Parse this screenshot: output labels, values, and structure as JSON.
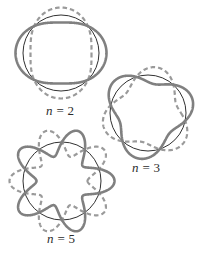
{
  "figure": {
    "background_color": "#ffffff",
    "width": 202,
    "height": 253,
    "style": {
      "circle_color": "#1a1a1a",
      "circle_width": 0.9,
      "solid_curve_color": "#808080",
      "solid_curve_width": 2.6,
      "dashed_curve_color": "#9a9a9a",
      "dashed_curve_width": 2.2,
      "dash_pattern": "4.5,3",
      "label_color": "#2b2b2b"
    }
  },
  "panels": [
    {
      "id": "n2",
      "label_prefix": "n",
      "label_equals": "=",
      "label_value": "2",
      "label_text": "n = 2",
      "n": 2,
      "center_x": 61,
      "center_y": 53,
      "circle_radius": 38,
      "amplitude": 7.5,
      "solid_phase_deg": 0,
      "dashed_phase_deg": 90,
      "label_x": 46,
      "label_y": 103
    },
    {
      "id": "n3",
      "label_prefix": "n",
      "label_equals": "=",
      "label_value": "3",
      "label_text": "n = 3",
      "n": 3,
      "center_x": 148,
      "center_y": 113,
      "circle_radius": 38,
      "amplitude": 8.5,
      "solid_phase_deg": -18,
      "dashed_phase_deg": 42,
      "label_x": 132,
      "label_y": 160
    },
    {
      "id": "n5",
      "label_prefix": "n",
      "label_equals": "=",
      "label_value": "5",
      "label_text": "n = 5",
      "n": 5,
      "center_x": 62,
      "center_y": 181,
      "circle_radius": 39,
      "amplitude": 13.5,
      "solid_phase_deg": 0,
      "dashed_phase_deg": 36,
      "label_x": 47,
      "label_y": 231
    }
  ],
  "chart_data": {
    "type": "line",
    "xlabel": "",
    "ylabel": "",
    "grid": false,
    "legend": "none",
    "series": [
      {
        "name": "n = 2 reference circle",
        "panel": "n2",
        "curve": "circle",
        "radius": 38,
        "center": [
          61,
          53
        ]
      },
      {
        "name": "n = 2 solid curve",
        "panel": "n2",
        "curve": "r = R + A*cos(n*theta)",
        "n": 2,
        "R": 38,
        "A": 7.5,
        "phase_deg": 0,
        "style": "solid"
      },
      {
        "name": "n = 2 dashed curve",
        "panel": "n2",
        "curve": "r = R + A*cos(n*(theta - 90deg))",
        "n": 2,
        "R": 38,
        "A": 7.5,
        "phase_deg": 90,
        "style": "dashed"
      },
      {
        "name": "n = 3 reference circle",
        "panel": "n3",
        "curve": "circle",
        "radius": 38,
        "center": [
          148,
          113
        ]
      },
      {
        "name": "n = 3 solid curve",
        "panel": "n3",
        "curve": "r = R + A*cos(n*(theta - phase))",
        "n": 3,
        "R": 38,
        "A": 8.5,
        "phase_deg": -18,
        "style": "solid"
      },
      {
        "name": "n = 3 dashed curve",
        "panel": "n3",
        "curve": "r = R + A*cos(n*(theta - phase))",
        "n": 3,
        "R": 38,
        "A": 8.5,
        "phase_deg": 42,
        "style": "dashed"
      },
      {
        "name": "n = 5 reference circle",
        "panel": "n5",
        "curve": "circle",
        "radius": 39,
        "center": [
          62,
          181
        ]
      },
      {
        "name": "n = 5 solid curve",
        "panel": "n5",
        "curve": "r = R + A*cos(n*(theta - phase))",
        "n": 5,
        "R": 39,
        "A": 13.5,
        "phase_deg": 0,
        "style": "solid"
      },
      {
        "name": "n = 5 dashed curve",
        "panel": "n5",
        "curve": "r = R + A*cos(n*(theta - phase))",
        "n": 5,
        "R": 39,
        "A": 13.5,
        "phase_deg": 36,
        "style": "dashed"
      }
    ],
    "annotations": [
      {
        "text": "n = 2",
        "x": 46,
        "y": 103
      },
      {
        "text": "n = 3",
        "x": 132,
        "y": 160
      },
      {
        "text": "n = 5",
        "x": 47,
        "y": 231
      }
    ]
  }
}
